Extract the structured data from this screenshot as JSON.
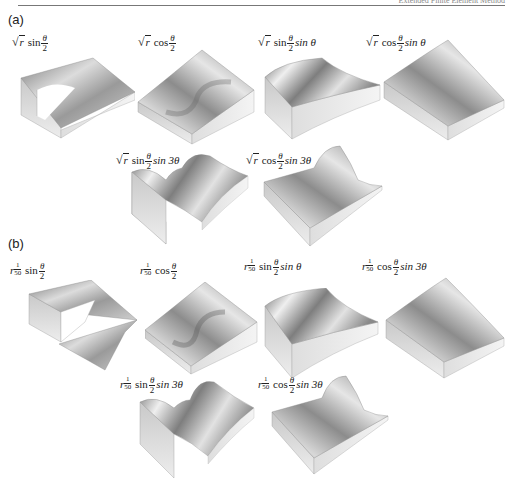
{
  "running_header": {
    "left": "",
    "right": "Extended Finite Element Method"
  },
  "figure": {
    "panels": [
      {
        "label": "(a)",
        "plots": [
          {
            "id": "a1",
            "radial": "sqrt(r)",
            "trig": "sin",
            "rest": ""
          },
          {
            "id": "a2",
            "radial": "sqrt(r)",
            "trig": "cos",
            "rest": ""
          },
          {
            "id": "a3",
            "radial": "sqrt(r)",
            "trig": "sin",
            "rest": "sin θ"
          },
          {
            "id": "a4",
            "radial": "sqrt(r)",
            "trig": "cos",
            "rest": "sin θ"
          },
          {
            "id": "a5",
            "radial": "sqrt(r)",
            "trig": "sin",
            "rest": "sin 3θ"
          },
          {
            "id": "a6",
            "radial": "sqrt(r)",
            "trig": "cos",
            "rest": "sin 3θ"
          }
        ]
      },
      {
        "label": "(b)",
        "plots": [
          {
            "id": "b1",
            "radial": "r^(1/50)",
            "trig": "sin",
            "rest": ""
          },
          {
            "id": "b2",
            "radial": "r^(1/50)",
            "trig": "cos",
            "rest": ""
          },
          {
            "id": "b3",
            "radial": "r^(1/50)",
            "trig": "sin",
            "rest": "sin θ"
          },
          {
            "id": "b4",
            "radial": "r^(1/50)",
            "trig": "cos",
            "rest": "sin 3θ"
          },
          {
            "id": "b5",
            "radial": "r^(1/50)",
            "trig": "sin",
            "rest": "sin 3θ"
          },
          {
            "id": "b6",
            "radial": "r^(1/50)",
            "trig": "cos",
            "rest": "sin 3θ"
          }
        ]
      }
    ],
    "symbols": {
      "theta": "θ",
      "two": "2",
      "sqrt": "√",
      "r": "r",
      "one": "1",
      "fifty": "50"
    }
  }
}
